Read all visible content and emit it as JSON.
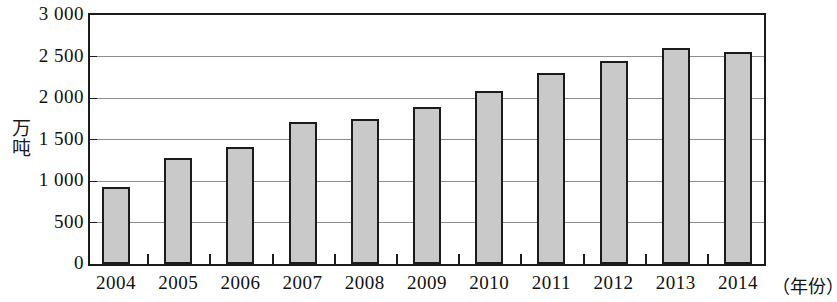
{
  "chart_data": {
    "type": "bar",
    "title": "",
    "subtitle": "",
    "xlabel": "（年份）",
    "ylabel": "万吨",
    "categories": [
      "2004",
      "2005",
      "2006",
      "2007",
      "2008",
      "2009",
      "2010",
      "2011",
      "2012",
      "2013",
      "2014"
    ],
    "values": [
      930,
      1280,
      1410,
      1715,
      1745,
      1890,
      2080,
      2300,
      2450,
      2600,
      2550
    ],
    "ylim": [
      0,
      3000
    ],
    "ytick_values": [
      0,
      500,
      1000,
      1500,
      2000,
      2500,
      3000
    ],
    "ytick_labels": [
      "0",
      "500",
      "1 000",
      "1 500",
      "2 000",
      "2 500",
      "3 000"
    ],
    "grid": true,
    "legend": false,
    "legend_position": "none",
    "bar_fill_color": "#c9c9c9",
    "bar_border_color": "#1b1b1b",
    "gridline_color": "#8d8d8d",
    "axis_color": "#1b1b1b",
    "annotations": []
  }
}
